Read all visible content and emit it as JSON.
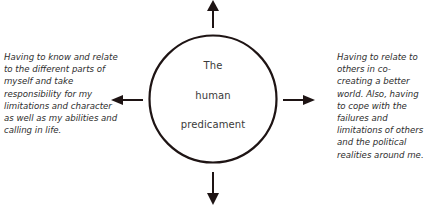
{
  "diagram": {
    "center": {
      "lines": [
        "The",
        "human",
        "predicament"
      ]
    },
    "left_text": "Having to know and relate to the different parts of myself and take responsibility for my limitations and character as well as my abilities and calling in life.",
    "right_text": "Having to relate to others in co-creating a better world. Also, having to cope with the failures and limitations of others and the political realities around me.",
    "arrows": [
      "up-arrow",
      "down-arrow",
      "left-arrow",
      "right-arrow"
    ],
    "colors": {
      "stroke": "#1e1414",
      "text": "#2e2e2e",
      "background": "#ffffff"
    }
  }
}
